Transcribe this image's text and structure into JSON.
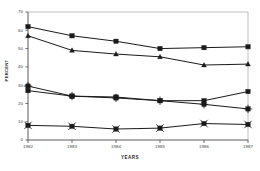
{
  "chart_data": {
    "type": "line",
    "title": "",
    "subtitle": "",
    "xlabel": "YEARS",
    "ylabel": "PERCENT",
    "x": [
      "1982",
      "1983",
      "1984",
      "1985",
      "1986",
      "1987"
    ],
    "categories": [
      "1982",
      "1983",
      "1984",
      "1985",
      "1986",
      "1987"
    ],
    "xlim": [
      1982,
      1987
    ],
    "ylim": [
      0,
      70
    ],
    "yticks": [
      0,
      10,
      20,
      30,
      40,
      50,
      60,
      70
    ],
    "ytick_labels": [
      "0",
      "10",
      "20",
      "30",
      "40",
      "50",
      "60",
      "70"
    ],
    "grid": false,
    "legend": "none",
    "series": [
      {
        "name": "series-1",
        "marker": "square",
        "color": "#1a1a1a",
        "values": [
          62,
          57,
          54,
          50,
          50.5,
          51
        ]
      },
      {
        "name": "series-2",
        "marker": "triangle",
        "color": "#1a1a1a",
        "values": [
          57,
          49,
          47,
          45.5,
          41,
          41.5
        ]
      },
      {
        "name": "series-3",
        "marker": "plus-square",
        "color": "#1a1a1a",
        "values": [
          29.5,
          24,
          23,
          21.5,
          19.5,
          17
        ]
      },
      {
        "name": "series-4",
        "marker": "square",
        "color": "#1a1a1a",
        "values": [
          27,
          24,
          23.5,
          21.5,
          21.5,
          26.5
        ]
      },
      {
        "name": "series-5",
        "marker": "x-square",
        "color": "#1a1a1a",
        "values": [
          8,
          7.5,
          6,
          6.5,
          9,
          8.5
        ]
      }
    ]
  },
  "axes": {
    "frame_color": "#b8b8b8",
    "axis_color": "#7a7a7a",
    "tick_color": "#5a5a5a"
  }
}
